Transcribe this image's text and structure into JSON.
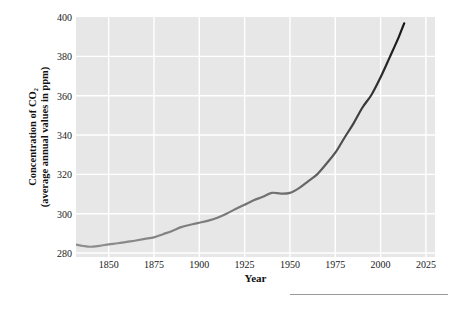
{
  "chart_data": {
    "type": "line",
    "title": "",
    "xlabel": "Year",
    "ylabel": "Concentration of CO₂ (average annual values in ppm)",
    "ylabel_line1": "Concentration of CO₂",
    "ylabel_line2": "(average annual values in ppm)",
    "xlim": [
      1832,
      2030
    ],
    "ylim": [
      278,
      400
    ],
    "xticks": [
      1850,
      1875,
      1900,
      1925,
      1950,
      1975,
      2000,
      2025
    ],
    "xtick_labels": [
      "1850",
      "1875",
      "1900",
      "1925",
      "1950",
      "1975",
      "2000",
      "2025"
    ],
    "yticks": [
      280,
      300,
      320,
      340,
      360,
      380,
      400
    ],
    "ytick_labels": [
      "280",
      "300",
      "320",
      "340",
      "360",
      "380",
      "400"
    ],
    "grid": true,
    "grid_color": "#ffffff",
    "plot_background": "#e7e7e7",
    "page_background": "#ffffff",
    "line_color_start": "#8a8a8a",
    "line_color_end": "#1b1b1b",
    "line_width": 2.2,
    "legend": null,
    "series": [
      {
        "name": "Atmospheric CO₂ concentration",
        "x": [
          1832,
          1836,
          1840,
          1845,
          1850,
          1855,
          1860,
          1865,
          1870,
          1875,
          1880,
          1885,
          1890,
          1895,
          1900,
          1905,
          1910,
          1915,
          1920,
          1925,
          1930,
          1935,
          1940,
          1945,
          1950,
          1955,
          1960,
          1965,
          1970,
          1975,
          1980,
          1985,
          1990,
          1995,
          2000,
          2005,
          2010,
          2013
        ],
        "y": [
          284.3,
          283.6,
          283.2,
          283.7,
          284.4,
          285.0,
          285.7,
          286.4,
          287.2,
          288.0,
          289.6,
          291.2,
          293.2,
          294.4,
          295.4,
          296.5,
          298.0,
          300.0,
          302.4,
          304.6,
          306.8,
          308.6,
          310.6,
          310.2,
          310.6,
          313.0,
          316.5,
          320.0,
          325.3,
          331.0,
          338.5,
          345.8,
          354.0,
          360.5,
          369.4,
          379.5,
          389.8,
          396.8
        ]
      }
    ],
    "annotations": []
  }
}
